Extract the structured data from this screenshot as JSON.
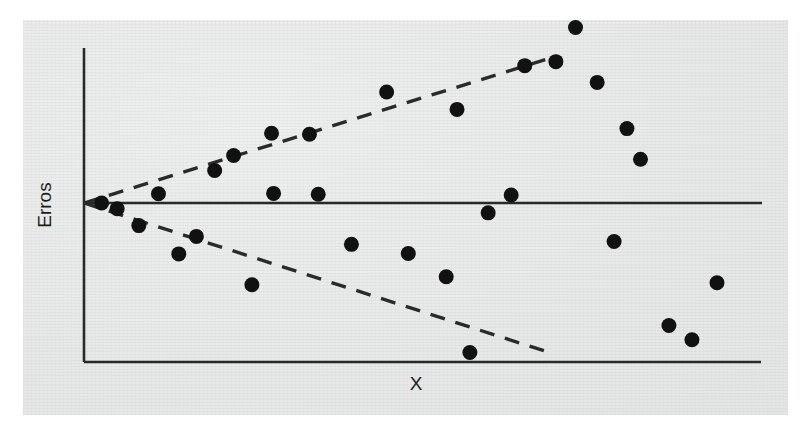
{
  "figure": {
    "background_color": "#ffffff",
    "paper_color": "#e8eaea",
    "ink_color": "#1c1c1c"
  },
  "labels": {
    "y_axis": "Erros",
    "x_axis": "X"
  },
  "chart_data": {
    "type": "scatter",
    "title": "",
    "subtitle": "",
    "xlabel": "X",
    "ylabel": "Erros",
    "xlim": [
      0,
      100
    ],
    "ylim": [
      -50,
      50
    ],
    "grid": false,
    "legend": null,
    "annotations": [
      {
        "name": "zero-reference-line",
        "style": "solid",
        "description": "Horizontal reference line at Erros = 0",
        "y": 0,
        "x_from": 0,
        "x_to": 100
      },
      {
        "name": "upper-envelope",
        "style": "dashed",
        "description": "Upper dashed envelope diverging from origin",
        "x_from": 0,
        "y_from": 0,
        "x_to": 71,
        "y_to": 43
      },
      {
        "name": "lower-envelope",
        "style": "dashed",
        "description": "Lower dashed envelope diverging from origin",
        "x_from": 0,
        "y_from": 0,
        "x_to": 70,
        "y_to": -43
      }
    ],
    "series": [
      {
        "name": "Erros",
        "marker": "filled-circle",
        "color": "#111111",
        "points": [
          {
            "x": 2.6,
            "y": 0.0
          },
          {
            "x": 4.9,
            "y": -1.8
          },
          {
            "x": 8.1,
            "y": -7.1
          },
          {
            "x": 11.0,
            "y": 3.0
          },
          {
            "x": 14.0,
            "y": -16.0
          },
          {
            "x": 16.6,
            "y": -10.5
          },
          {
            "x": 19.3,
            "y": 10.5
          },
          {
            "x": 22.1,
            "y": 15.3
          },
          {
            "x": 24.8,
            "y": -25.7
          },
          {
            "x": 27.7,
            "y": 22.5
          },
          {
            "x": 28.0,
            "y": 3.1
          },
          {
            "x": 33.3,
            "y": 22.2
          },
          {
            "x": 34.6,
            "y": 2.8
          },
          {
            "x": 39.5,
            "y": -13.0
          },
          {
            "x": 44.7,
            "y": 35.8
          },
          {
            "x": 47.9,
            "y": -15.9
          },
          {
            "x": 53.5,
            "y": -23.2
          },
          {
            "x": 55.1,
            "y": 30.2
          },
          {
            "x": 57.0,
            "y": -47.0
          },
          {
            "x": 59.7,
            "y": -3.1
          },
          {
            "x": 63.1,
            "y": 2.6
          },
          {
            "x": 65.1,
            "y": 44.3
          },
          {
            "x": 69.7,
            "y": 45.6
          },
          {
            "x": 72.6,
            "y": 56.6
          },
          {
            "x": 75.8,
            "y": 38.9
          },
          {
            "x": 78.3,
            "y": -12.1
          },
          {
            "x": 80.2,
            "y": 24.0
          },
          {
            "x": 82.2,
            "y": 14.1
          },
          {
            "x": 86.4,
            "y": -38.5
          },
          {
            "x": 89.8,
            "y": -43.0
          },
          {
            "x": 93.5,
            "y": -25.1
          }
        ]
      }
    ]
  },
  "geometry": {
    "plot_area": {
      "left": 84,
      "top": 48,
      "right": 761,
      "bottom": 362
    },
    "origin": {
      "x": 84,
      "y": 203
    },
    "mean_line_y": 203,
    "upper_envelope_end": {
      "x": 557,
      "y": 56
    },
    "lower_envelope_end": {
      "x": 554,
      "y": 354
    },
    "point_radius": 7.5,
    "y_label_position": {
      "x": 46,
      "y": 205
    },
    "x_label_position": {
      "x": 416,
      "y": 378
    }
  }
}
